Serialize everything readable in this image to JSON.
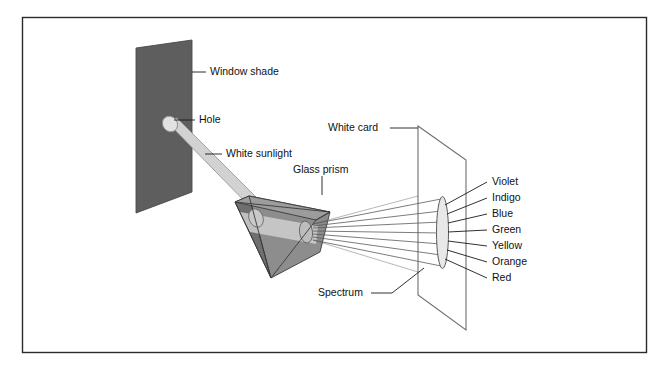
{
  "figure": {
    "background_color": "#ffffff",
    "border_color": "#2b2b2b"
  },
  "labels": {
    "window_shade": "Window shade",
    "hole": "Hole",
    "white_sunlight": "White sunlight",
    "glass_prism": "Glass prism",
    "white_card": "White card",
    "spectrum": "Spectrum"
  },
  "spectrum_colors": [
    {
      "name": "Violet"
    },
    {
      "name": "Indigo"
    },
    {
      "name": "Blue"
    },
    {
      "name": "Green"
    },
    {
      "name": "Yellow"
    },
    {
      "name": "Orange"
    },
    {
      "name": "Red"
    }
  ],
  "colors": {
    "shade_fill": "#5e5e5e",
    "shade_edge": "#3a3a3a",
    "beam_fill": "#d2d2d2",
    "beam_edge": "#8a8a8a",
    "prism_front": "#8d8d8d",
    "prism_left": "#6f6f6f",
    "prism_top": "#9c9c9c",
    "prism_band": "#cfcfcf",
    "card_fill": "#ffffff",
    "card_edge": "#6e6e6e",
    "ray_stroke": "#5a5a5a",
    "ellipse_fill": "#e8e8e8",
    "text": "#111111"
  }
}
